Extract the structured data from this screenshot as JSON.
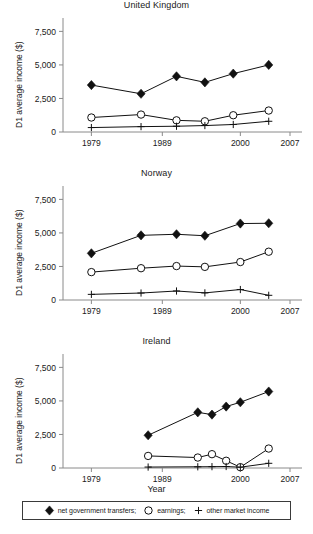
{
  "figure": {
    "width": 313,
    "height": 534,
    "xlabel": "Year",
    "ylabel": "D1 average income ($)"
  },
  "legend": {
    "entries": [
      {
        "symbol": "diamond",
        "label": "net government transfers;"
      },
      {
        "symbol": "circle",
        "label": "earnings;"
      },
      {
        "symbol": "plus",
        "label": "other market income"
      }
    ]
  },
  "chart_data": [
    {
      "type": "line",
      "title": "United Kingdom",
      "xlabel": "",
      "ylabel": "D1 average income ($)",
      "xlim": [
        1975,
        2007
      ],
      "ylim": [
        0,
        8200
      ],
      "xticks": [
        1979,
        1989,
        2000,
        2007
      ],
      "xticklabels": [
        "1979",
        "1989",
        "2000",
        "2007"
      ],
      "yticks": [
        0,
        2500,
        5000,
        7500
      ],
      "yticklabels": [
        "0",
        "2,500",
        "5,000",
        "7,500"
      ],
      "grid": false,
      "legend_position": "below-figure",
      "series": [
        {
          "name": "net government transfers",
          "marker": "diamond",
          "x": [
            1979,
            1986,
            1991,
            1995,
            1999,
            2004
          ],
          "values": [
            3500,
            2850,
            4150,
            3700,
            4350,
            5000
          ]
        },
        {
          "name": "earnings",
          "marker": "circle",
          "x": [
            1979,
            1986,
            1991,
            1995,
            1999,
            2004
          ],
          "values": [
            1080,
            1300,
            870,
            800,
            1250,
            1600
          ]
        },
        {
          "name": "other market income",
          "marker": "plus",
          "x": [
            1979,
            1986,
            1991,
            1995,
            1999,
            2004
          ],
          "values": [
            330,
            400,
            430,
            480,
            560,
            800
          ]
        }
      ]
    },
    {
      "type": "line",
      "title": "Norway",
      "xlabel": "",
      "ylabel": "D1 average income ($)",
      "xlim": [
        1975,
        2007
      ],
      "ylim": [
        0,
        8200
      ],
      "xticks": [
        1979,
        1989,
        2000,
        2007
      ],
      "xticklabels": [
        "1979",
        "1989",
        "2000",
        "2007"
      ],
      "yticks": [
        0,
        2500,
        5000,
        7500
      ],
      "yticklabels": [
        "0",
        "2,500",
        "5,000",
        "7,500"
      ],
      "grid": false,
      "legend_position": "below-figure",
      "series": [
        {
          "name": "net government transfers",
          "marker": "diamond",
          "x": [
            1979,
            1986,
            1991,
            1995,
            2000,
            2004
          ],
          "values": [
            3480,
            4820,
            4900,
            4790,
            5700,
            5720
          ]
        },
        {
          "name": "earnings",
          "marker": "circle",
          "x": [
            1979,
            1986,
            1991,
            1995,
            2000,
            2004
          ],
          "values": [
            2080,
            2370,
            2530,
            2470,
            2830,
            3600
          ]
        },
        {
          "name": "other market income",
          "marker": "plus",
          "x": [
            1979,
            1986,
            1991,
            1995,
            2000,
            2004
          ],
          "values": [
            420,
            520,
            670,
            530,
            780,
            350
          ]
        }
      ]
    },
    {
      "type": "line",
      "title": "Ireland",
      "xlabel": "Year",
      "ylabel": "D1 average income ($)",
      "xlim": [
        1975,
        2007
      ],
      "ylim": [
        0,
        8200
      ],
      "xticks": [
        1979,
        1989,
        2000,
        2007
      ],
      "xticklabels": [
        "1979",
        "1989",
        "2000",
        "2007"
      ],
      "yticks": [
        0,
        2500,
        5000,
        7500
      ],
      "yticklabels": [
        "0",
        "2,500",
        "5,000",
        "7,500"
      ],
      "grid": false,
      "legend_position": "below-figure",
      "series": [
        {
          "name": "net government transfers",
          "marker": "diamond",
          "x": [
            1987,
            1994,
            1996,
            1998,
            2000,
            2004
          ],
          "values": [
            2440,
            4150,
            3980,
            4580,
            4900,
            5700
          ]
        },
        {
          "name": "earnings",
          "marker": "circle",
          "x": [
            1987,
            1994,
            1996,
            1998,
            2000,
            2004
          ],
          "values": [
            900,
            780,
            1030,
            540,
            60,
            1450
          ]
        },
        {
          "name": "other market income",
          "marker": "plus",
          "x": [
            1987,
            1994,
            1996,
            1998,
            2000,
            2004
          ],
          "values": [
            70,
            90,
            100,
            110,
            60,
            350
          ]
        }
      ]
    }
  ]
}
